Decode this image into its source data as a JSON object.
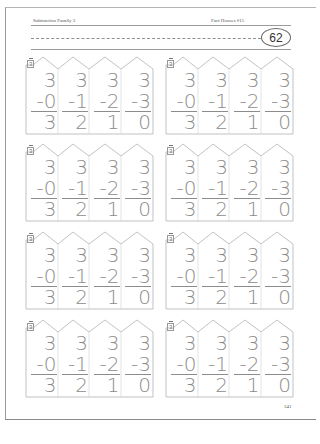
{
  "header": {
    "left_title": "Subtraction Family 3",
    "right_title": "Fact Houses #15",
    "badge_number": "62"
  },
  "footer": {
    "page_number": "341"
  },
  "houses": [
    {
      "tag": "3",
      "problems": [
        {
          "top": "3",
          "sub": "-0",
          "answer": "3"
        },
        {
          "top": "3",
          "sub": "-1",
          "answer": "2"
        },
        {
          "top": "3",
          "sub": "-2",
          "answer": "1"
        },
        {
          "top": "3",
          "sub": "-3",
          "answer": "0"
        }
      ]
    },
    {
      "tag": "3",
      "problems": [
        {
          "top": "3",
          "sub": "-0",
          "answer": "3"
        },
        {
          "top": "3",
          "sub": "-1",
          "answer": "2"
        },
        {
          "top": "3",
          "sub": "-2",
          "answer": "1"
        },
        {
          "top": "3",
          "sub": "-3",
          "answer": "0"
        }
      ]
    },
    {
      "tag": "3",
      "problems": [
        {
          "top": "3",
          "sub": "-0",
          "answer": "3"
        },
        {
          "top": "3",
          "sub": "-1",
          "answer": "2"
        },
        {
          "top": "3",
          "sub": "-2",
          "answer": "1"
        },
        {
          "top": "3",
          "sub": "-3",
          "answer": "0"
        }
      ]
    },
    {
      "tag": "3",
      "problems": [
        {
          "top": "3",
          "sub": "-0",
          "answer": "3"
        },
        {
          "top": "3",
          "sub": "-1",
          "answer": "2"
        },
        {
          "top": "3",
          "sub": "-2",
          "answer": "1"
        },
        {
          "top": "3",
          "sub": "-3",
          "answer": "0"
        }
      ]
    },
    {
      "tag": "3",
      "problems": [
        {
          "top": "3",
          "sub": "-0",
          "answer": "3"
        },
        {
          "top": "3",
          "sub": "-1",
          "answer": "2"
        },
        {
          "top": "3",
          "sub": "-2",
          "answer": "1"
        },
        {
          "top": "3",
          "sub": "-3",
          "answer": "0"
        }
      ]
    },
    {
      "tag": "3",
      "problems": [
        {
          "top": "3",
          "sub": "-0",
          "answer": "3"
        },
        {
          "top": "3",
          "sub": "-1",
          "answer": "2"
        },
        {
          "top": "3",
          "sub": "-2",
          "answer": "1"
        },
        {
          "top": "3",
          "sub": "-3",
          "answer": "0"
        }
      ]
    },
    {
      "tag": "3",
      "problems": [
        {
          "top": "3",
          "sub": "-0",
          "answer": "3"
        },
        {
          "top": "3",
          "sub": "-1",
          "answer": "2"
        },
        {
          "top": "3",
          "sub": "-2",
          "answer": "1"
        },
        {
          "top": "3",
          "sub": "-3",
          "answer": "0"
        }
      ]
    },
    {
      "tag": "3",
      "problems": [
        {
          "top": "3",
          "sub": "-0",
          "answer": "3"
        },
        {
          "top": "3",
          "sub": "-1",
          "answer": "2"
        },
        {
          "top": "3",
          "sub": "-2",
          "answer": "1"
        },
        {
          "top": "3",
          "sub": "-3",
          "answer": "0"
        }
      ]
    }
  ],
  "colors": {
    "digits": "#8c8c8c",
    "outline": "#b0b0b0",
    "text": "#555555"
  }
}
